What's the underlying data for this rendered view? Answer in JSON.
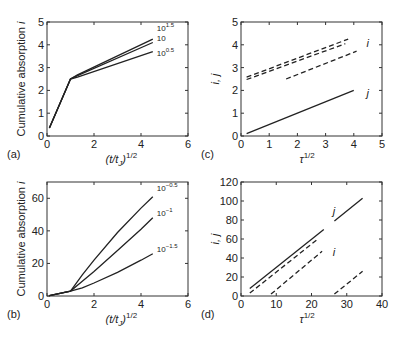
{
  "chart_data": [
    {
      "panel": "(a)",
      "type": "line",
      "xlabel": "(t/t_J)^1/2",
      "ylabel": "Cumulative absorption i",
      "xlim": [
        0,
        6
      ],
      "ylim": [
        0,
        5
      ],
      "xticks": [
        "0",
        "2",
        "4",
        "6"
      ],
      "yticks": [
        "0",
        "1",
        "2",
        "3",
        "4",
        "5"
      ],
      "series": [
        {
          "name": "10^1.5",
          "style": "solid",
          "points": [
            [
              0.1,
              0.35
            ],
            [
              1.0,
              2.5
            ],
            [
              1.3,
              2.68
            ],
            [
              4.5,
              4.25
            ]
          ]
        },
        {
          "name": "10",
          "style": "solid",
          "points": [
            [
              0.1,
              0.35
            ],
            [
              1.0,
              2.5
            ],
            [
              1.3,
              2.65
            ],
            [
              4.5,
              4.1
            ]
          ]
        },
        {
          "name": "10^0.5",
          "style": "solid",
          "points": [
            [
              0.1,
              0.35
            ],
            [
              1.0,
              2.5
            ],
            [
              1.3,
              2.58
            ],
            [
              4.5,
              3.7
            ]
          ]
        }
      ],
      "annotations": [
        "10^1.5",
        "10",
        "10^0.5"
      ]
    },
    {
      "panel": "(b)",
      "type": "line",
      "xlabel": "(t/t_J)^1/2",
      "ylabel": "Cumulative absorption i",
      "xlim": [
        0,
        6
      ],
      "ylim": [
        0,
        70
      ],
      "xticks": [
        "0",
        "2",
        "4",
        "6"
      ],
      "yticks": [
        "0",
        "20",
        "40",
        "60"
      ],
      "series": [
        {
          "name": "10^-0.5",
          "style": "solid",
          "points": [
            [
              0.1,
              0.2
            ],
            [
              1.0,
              3
            ],
            [
              1.5,
              13
            ],
            [
              2,
              22
            ],
            [
              3,
              39
            ],
            [
              4,
              54
            ],
            [
              4.5,
              61
            ]
          ]
        },
        {
          "name": "10^-1",
          "style": "solid",
          "points": [
            [
              0.1,
              0.2
            ],
            [
              1.0,
              3
            ],
            [
              1.5,
              9
            ],
            [
              2,
              15
            ],
            [
              3,
              28
            ],
            [
              4,
              41
            ],
            [
              4.5,
              48
            ]
          ]
        },
        {
          "name": "10^-1.5",
          "style": "solid",
          "points": [
            [
              0.1,
              0.2
            ],
            [
              1.0,
              3
            ],
            [
              1.5,
              5
            ],
            [
              2,
              8
            ],
            [
              3,
              14.5
            ],
            [
              4,
              22
            ],
            [
              4.5,
              26
            ]
          ]
        }
      ],
      "annotations": [
        "10^-0.5",
        "10^-1",
        "10^-1.5"
      ]
    },
    {
      "panel": "(c)",
      "type": "line",
      "xlabel": "τ^1/2",
      "ylabel": "i, j",
      "xlim": [
        0,
        5
      ],
      "ylim": [
        0,
        5
      ],
      "xticks": [
        "0",
        "1",
        "2",
        "3",
        "4",
        "5"
      ],
      "yticks": [
        "0",
        "1",
        "2",
        "3",
        "4",
        "5"
      ],
      "series": [
        {
          "name": "i (1)",
          "style": "dashed",
          "points": [
            [
              0.2,
              2.58
            ],
            [
              3.8,
              4.25
            ]
          ]
        },
        {
          "name": "i (2)",
          "style": "dashed",
          "points": [
            [
              0.2,
              2.48
            ],
            [
              3.7,
              4.05
            ]
          ]
        },
        {
          "name": "i (3)",
          "style": "dashed",
          "points": [
            [
              1.6,
              2.5
            ],
            [
              4.1,
              3.72
            ]
          ]
        },
        {
          "name": "j",
          "style": "solid",
          "points": [
            [
              0.2,
              0.1
            ],
            [
              4.0,
              2.0
            ]
          ]
        }
      ],
      "annotations": [
        "i",
        "j"
      ]
    },
    {
      "panel": "(d)",
      "type": "line",
      "xlabel": "τ^1/2",
      "ylabel": "i, j",
      "xlim": [
        0,
        40
      ],
      "ylim": [
        0,
        120
      ],
      "xticks": [
        "0",
        "10",
        "20",
        "30",
        "40"
      ],
      "yticks": [
        "0",
        "20",
        "40",
        "60",
        "80",
        "100",
        "120"
      ],
      "series": [
        {
          "name": "j (1)",
          "style": "solid",
          "points": [
            [
              2.5,
              8
            ],
            [
              23.5,
              70
            ]
          ]
        },
        {
          "name": "j (2)",
          "style": "solid",
          "points": [
            [
              26.5,
              79
            ],
            [
              34.5,
              103
            ]
          ]
        },
        {
          "name": "i (1)",
          "style": "dashed",
          "points": [
            [
              2.5,
              3
            ],
            [
              21.5,
              59
            ]
          ]
        },
        {
          "name": "i (2)",
          "style": "dashed",
          "points": [
            [
              8.5,
              2
            ],
            [
              23,
              47
            ]
          ]
        },
        {
          "name": "i (3)",
          "style": "dashed",
          "points": [
            [
              26.5,
              2
            ],
            [
              34.5,
              26
            ]
          ]
        }
      ],
      "annotations": [
        "j",
        "i"
      ]
    }
  ],
  "panels": {
    "a": {
      "tag": "(a)",
      "xlabel_base": "(t/t",
      "xlabel_sub": "J",
      "xlabel_close": ")",
      "xlabel_sup": "1/2",
      "ylabel": "Cumulative absorption",
      "ylabel_var": "i",
      "curve_labels": [
        {
          "base": "10",
          "sup": "1.5"
        },
        {
          "base": "10",
          "sup": ""
        },
        {
          "base": "10",
          "sup": "0.5"
        }
      ]
    },
    "b": {
      "tag": "(b)",
      "xlabel_base": "(t/t",
      "xlabel_sub": "J",
      "xlabel_close": ")",
      "xlabel_sup": "1/2",
      "ylabel": "Cumulative absorption",
      "ylabel_var": "i",
      "curve_labels": [
        {
          "base": "10",
          "sup": "−0.5"
        },
        {
          "base": "10",
          "sup": "−1"
        },
        {
          "base": "10",
          "sup": "−1.5"
        }
      ]
    },
    "c": {
      "tag": "(c)",
      "xlabel_base": "τ",
      "xlabel_sup": "1/2",
      "ylabel": "i, j",
      "label_i": "i",
      "label_j": "j"
    },
    "d": {
      "tag": "(d)",
      "xlabel_base": "τ",
      "xlabel_sup": "1/2",
      "ylabel": "i, j",
      "label_i": "i",
      "label_j": "j"
    }
  }
}
